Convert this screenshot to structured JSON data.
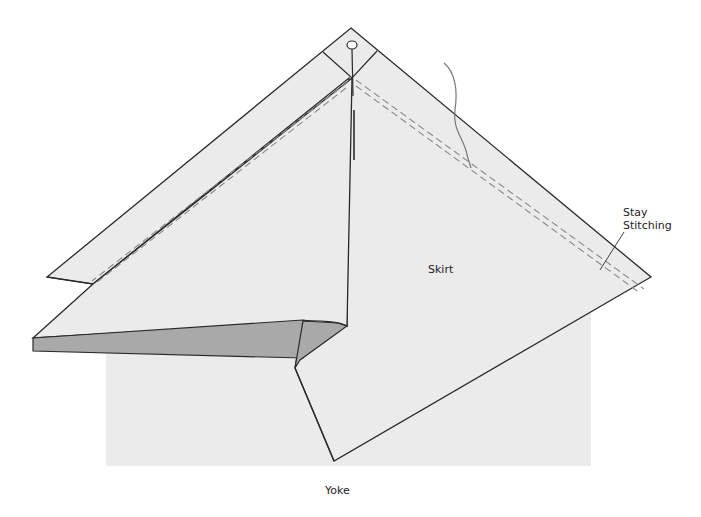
{
  "diagram": {
    "type": "sewing-construction-illustration",
    "labels": {
      "skirt": "Skirt",
      "yoke": "Yoke",
      "stay_stitching_line1": "Stay",
      "stay_stitching_line2": "Stitching"
    },
    "parts": [
      {
        "name": "yoke",
        "description": "Rectangular yoke piece at the bottom"
      },
      {
        "name": "skirt",
        "description": "Diamond-shaped skirt piece with folded front flap"
      },
      {
        "name": "front-flap",
        "description": "Folded skirt corner revealing reverse side"
      },
      {
        "name": "pin",
        "description": "Straight pin at top apex"
      },
      {
        "name": "thread",
        "description": "Loose thread end near stitching"
      },
      {
        "name": "stay-stitching",
        "description": "Dashed stay-stitching lines along bias edges"
      }
    ],
    "colors": {
      "fabric": "#ebebeb",
      "fabric_reverse": "#a9a9a9",
      "outline": "#2a2a2a",
      "stitching": "#8a8a8a",
      "background": "#ffffff"
    }
  }
}
